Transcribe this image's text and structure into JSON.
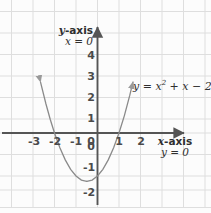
{
  "figure": {
    "background_color": "#fcfcfc",
    "grid_color": "#dedede",
    "axis_color": "#555555",
    "curve_color": "#8a8a8a",
    "text_color": "#2f2f2f"
  },
  "labels": {
    "y_axis_name": "y-axis",
    "y_axis_name_italic": "y",
    "y_axis_name_rest": "-axis",
    "y_axis_equation": "x = 0",
    "x_axis_name": "x-axis",
    "x_axis_name_italic": "x",
    "x_axis_name_rest": "-axis",
    "x_axis_equation": "y = 0",
    "curve_equation": "y = x² + x − 2",
    "curve_eq_lhs": "y = x",
    "curve_eq_exp": "2",
    "curve_eq_rhs": " + x − 2"
  },
  "chart_data": {
    "type": "line",
    "xlabel": "x-axis",
    "ylabel": "y-axis",
    "xlim": [
      -4.5,
      5.3
    ],
    "ylim": [
      -3.7,
      5.7
    ],
    "grid": true,
    "grid_spacing": 1,
    "legend": "none",
    "annotations": [
      {
        "text": "y-axis",
        "note": "vertical axis name, x = 0"
      },
      {
        "text": "x = 0",
        "note": "equation of the y-axis"
      },
      {
        "text": "x-axis",
        "note": "horizontal axis name, y = 0"
      },
      {
        "text": "y = 0",
        "note": "equation of the x-axis"
      },
      {
        "text": "y = x² + x − 2",
        "note": "equation of the plotted parabola"
      }
    ],
    "x_ticks": [
      -3,
      -2,
      -1,
      0,
      1,
      2
    ],
    "x_tick_labels": [
      "3",
      "2",
      "1",
      "0",
      "1",
      "2"
    ],
    "x_tick_labels_signed": [
      "-3",
      "-2",
      "-1",
      "0",
      "1",
      "2"
    ],
    "y_ticks": [
      4,
      3,
      2,
      1,
      0,
      -1,
      -2,
      -3
    ],
    "y_tick_labels": [
      "4",
      "3",
      "2",
      "1",
      "0",
      "1",
      "2",
      "3"
    ],
    "y_tick_labels_signed": [
      "4",
      "3",
      "2",
      "1",
      "0",
      "-1",
      "-2",
      "-3"
    ],
    "series": [
      {
        "name": "y = x² + x − 2",
        "equation": "y = x^2 + x - 2",
        "color": "#8a8a8a",
        "roots": [
          -2,
          1
        ],
        "vertex": [
          -0.5,
          -2.25
        ],
        "y_intercept": -2,
        "arrow_start": true,
        "arrow_end": true,
        "x": [
          -2.65,
          -2.4,
          -2.2,
          -2.0,
          -1.75,
          -1.5,
          -1.25,
          -1.0,
          -0.75,
          -0.5,
          -0.25,
          0.0,
          0.25,
          0.5,
          0.75,
          1.0,
          1.25,
          1.5,
          1.65
        ],
        "values": [
          2.37,
          1.36,
          0.64,
          0.0,
          -0.69,
          -1.25,
          -1.69,
          -2.0,
          -2.19,
          -2.25,
          -2.19,
          -2.0,
          -1.69,
          -1.25,
          -0.69,
          0.0,
          0.81,
          1.75,
          2.37
        ]
      }
    ]
  }
}
